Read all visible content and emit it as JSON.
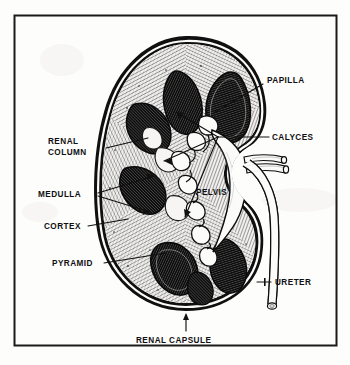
{
  "figure": {
    "frame_color": "#1a1a1a",
    "background_color": "#fdfdfc",
    "ink_color": "#101010"
  },
  "labels": {
    "papilla": "PAPILLA",
    "calyces": "CALYCES",
    "renal_column_line1": "RENAL",
    "renal_column_line2": "COLUMN",
    "medulla": "MEDULLA",
    "cortex": "CORTEX",
    "pyramid": "PYRAMID",
    "pelvis": "PELVIS",
    "ureter": "URETER",
    "renal_capsule": "RENAL CAPSULE"
  },
  "label_positions": {
    "papilla": {
      "x": 267,
      "y": 80
    },
    "calyces": {
      "x": 272,
      "y": 140
    },
    "renal_column_line1": {
      "x": 48,
      "y": 141
    },
    "renal_column_line2": {
      "x": 48,
      "y": 152
    },
    "medulla": {
      "x": 38,
      "y": 196
    },
    "cortex": {
      "x": 44,
      "y": 229
    },
    "pyramid": {
      "x": 52,
      "y": 266
    },
    "pelvis": {
      "x": 196,
      "y": 192
    },
    "ureter": {
      "x": 275,
      "y": 285
    },
    "renal_capsule": {
      "x": 136,
      "y": 340
    }
  },
  "parts": [
    {
      "name": "renal-capsule",
      "description": "thick dark outer boundary of the kidney"
    },
    {
      "name": "cortex",
      "description": "outer radially hatched zone beneath the capsule"
    },
    {
      "name": "medulla",
      "description": "inner zone containing the renal pyramids"
    },
    {
      "name": "renal-pyramid",
      "description": "dark triangular striated mass in the medulla"
    },
    {
      "name": "renal-column",
      "description": "cortical tissue extending between pyramids"
    },
    {
      "name": "papilla",
      "description": "apex of a renal pyramid projecting into a calyx"
    },
    {
      "name": "minor-calyx",
      "description": "cup receiving urine from a papilla"
    },
    {
      "name": "renal-pelvis",
      "description": "funnel-shaped collecting chamber at the hilum"
    },
    {
      "name": "ureter",
      "description": "tube draining urine from the pelvis"
    },
    {
      "name": "renal-vessels",
      "description": "artery and vein entering at the hilum"
    }
  ]
}
